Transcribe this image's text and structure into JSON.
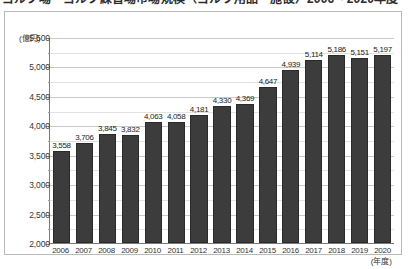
{
  "title": "ゴルフ場・ゴルフ練習場市場規模（ゴルフ用品・施設）2006～2020年度",
  "chart": {
    "y_unit_label": "(億円)",
    "x_unit_label": "(年度)"
  },
  "chart_data": {
    "type": "bar",
    "title": "ゴルフ場・ゴルフ練習場市場規模（ゴルフ用品・施設）2006～2020年度",
    "xlabel": "(年度)",
    "ylabel": "(億円)",
    "ylim": [
      2000,
      5500
    ],
    "ytick_step": 500,
    "yticks": [
      2000,
      2500,
      3000,
      3500,
      4000,
      4500,
      5000,
      5500
    ],
    "ytick_labels": [
      "2,000",
      "2,500",
      "3,000",
      "3,500",
      "4,000",
      "4,500",
      "5,000",
      "5,500"
    ],
    "minor_gridlines": true,
    "minor_step": 250,
    "grid": true,
    "legend": false,
    "bar_color": "#3c3c3c",
    "categories": [
      "2006",
      "2007",
      "2008",
      "2009",
      "2010",
      "2011",
      "2012",
      "2013",
      "2014",
      "2015",
      "2016",
      "2017",
      "2018",
      "2019",
      "2020"
    ],
    "values": [
      3558,
      3706,
      3845,
      3832,
      4063,
      4058,
      4181,
      4330,
      4369,
      4647,
      4939,
      5114,
      5186,
      5151,
      5197
    ],
    "data_labels": [
      "3,558",
      "3,706",
      "3,845",
      "3,832",
      "4,063",
      "4,058",
      "4,181",
      "4,330",
      "4,369",
      "4,647",
      "4,939",
      "5,114",
      "5,186",
      "5,151",
      "5,197"
    ]
  }
}
